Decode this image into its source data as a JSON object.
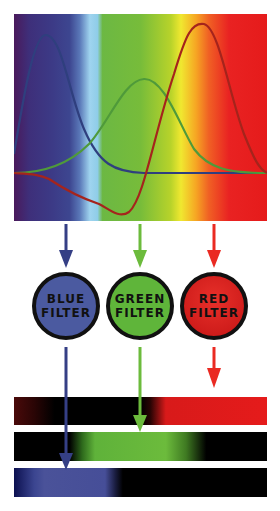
{
  "diagram": {
    "curves": [
      {
        "name": "blue-sensitivity",
        "color": "#2f3f7e"
      },
      {
        "name": "green-sensitivity",
        "color": "#4f9a3a"
      },
      {
        "name": "red-sensitivity",
        "color": "#a5241c"
      }
    ],
    "filters": [
      {
        "line1": "BLUE",
        "line2": "FILTER",
        "color": "#4b5aa0"
      },
      {
        "line1": "GREEN",
        "line2": "FILTER",
        "color": "#5fb53a"
      },
      {
        "line1": "RED",
        "line2": "FILTER",
        "color": "#e51f1f"
      }
    ],
    "arrow_colors": {
      "blue": "#353f85",
      "green": "#6cbb3c",
      "red": "#ea2a22"
    },
    "output_bars": [
      {
        "name": "red-channel",
        "color": "#e51b1b"
      },
      {
        "name": "green-channel",
        "color": "#6cbb3c"
      },
      {
        "name": "blue-channel",
        "color": "#464e98"
      }
    ]
  }
}
